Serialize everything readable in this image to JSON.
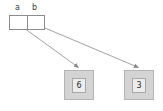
{
  "diagram": {
    "background_color": "#ffffff",
    "line_color": "#8c8c8c",
    "object_fill_color": "#d4d4d4",
    "object_inner_fill_color": "#ededed"
  },
  "variables": {
    "labels": [
      "a",
      "b"
    ],
    "cells": [
      {
        "name": "a",
        "value": ""
      },
      {
        "name": "b",
        "value": ""
      }
    ]
  },
  "objects": [
    {
      "value": "6"
    },
    {
      "value": "3"
    }
  ],
  "edges": [
    {
      "from": "a",
      "to": "6"
    },
    {
      "from": "b",
      "to": "3"
    }
  ]
}
